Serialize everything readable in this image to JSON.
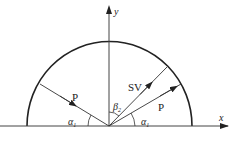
{
  "diagram": {
    "axes": {
      "x_label": "x",
      "y_label": "y"
    },
    "rays": [
      {
        "label": "P",
        "direction": "incoming",
        "side": "left"
      },
      {
        "label": "SV",
        "direction": "outgoing",
        "side": "right"
      },
      {
        "label": "P",
        "direction": "outgoing",
        "side": "right"
      }
    ],
    "angles": [
      {
        "symbol": "α",
        "subscript": "1",
        "side": "left"
      },
      {
        "symbol": "β",
        "subscript": "2",
        "side": "center"
      },
      {
        "symbol": "α",
        "subscript": "1",
        "side": "right"
      }
    ],
    "colors": {
      "stroke": "#222222",
      "background": "#ffffff"
    }
  }
}
